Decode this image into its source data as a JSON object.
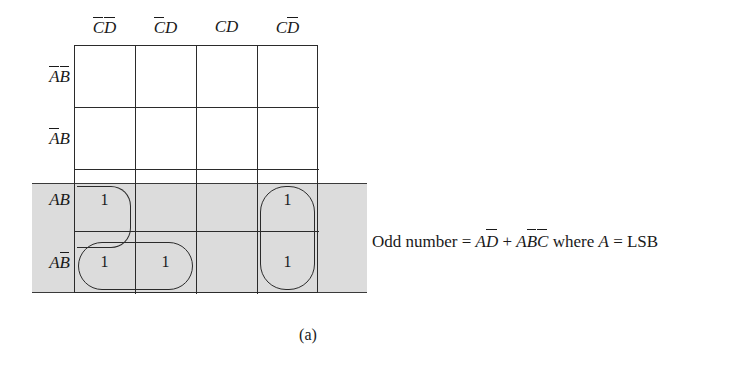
{
  "figure": {
    "caption": "(a)",
    "type": "karnaugh-map",
    "variables": [
      "A",
      "B",
      "C",
      "D"
    ]
  },
  "kmap": {
    "column_headers": [
      {
        "id": "c0",
        "text": "CD",
        "bars": [
          "C",
          "D"
        ],
        "label": "C̄D̄"
      },
      {
        "id": "c1",
        "text": "CD",
        "bars": [
          "C"
        ],
        "label": "C̄D"
      },
      {
        "id": "c2",
        "text": "CD",
        "bars": [],
        "label": "CD"
      },
      {
        "id": "c3",
        "text": "CD",
        "bars": [
          "D"
        ],
        "label": "CD̄"
      }
    ],
    "row_headers": [
      {
        "id": "r0",
        "text": "AB",
        "bars": [
          "A",
          "B"
        ],
        "label": "ĀB̄"
      },
      {
        "id": "r1",
        "text": "AB",
        "bars": [
          "A"
        ],
        "label": "ĀB"
      },
      {
        "id": "r2",
        "text": "AB",
        "bars": [],
        "label": "AB"
      },
      {
        "id": "r3",
        "text": "AB",
        "bars": [
          "B"
        ],
        "label": "AB̄"
      }
    ],
    "cells": [
      [
        "",
        "",
        "",
        ""
      ],
      [
        "",
        "",
        "",
        ""
      ],
      [
        "1",
        "",
        "",
        "1"
      ],
      [
        "1",
        "1",
        "",
        "1"
      ]
    ],
    "shaded_rows": [
      "AB",
      "AB̄"
    ],
    "shade_color": "#dcdcdc",
    "line_color": "#2b2b2b",
    "groups": [
      {
        "name": "AD-bar",
        "cells": "column CD̄ rows AB and AB̄"
      },
      {
        "name": "AB-bar-C-bar",
        "cells": "row AB̄ columns C̄D̄ and C̄D, plus AB row C̄D̄"
      }
    ]
  },
  "equation": {
    "lhs": "Odd number",
    "eq1": "=",
    "term1_base": "AD",
    "plus": "+",
    "term2_base": "ABC",
    "where": "where",
    "var": "A",
    "eq2": "=",
    "rhs": "LSB",
    "full_text": "Odd number = AD̄ + AB̄C̄ where A = LSB"
  }
}
